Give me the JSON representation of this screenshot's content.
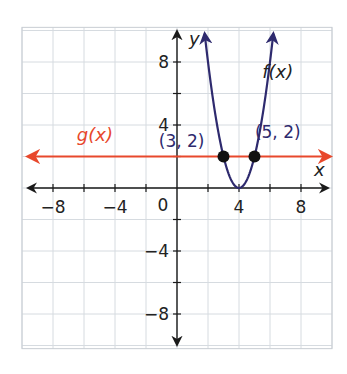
{
  "chart_data": {
    "type": "line",
    "title": "",
    "xlabel": "x",
    "ylabel": "y",
    "xlim": [
      -10,
      10
    ],
    "ylim": [
      -10.2,
      10.2
    ],
    "grid": true,
    "grid_step": 2,
    "x_ticks": [
      -8,
      -6,
      -4,
      -2,
      2,
      4,
      6,
      8
    ],
    "y_ticks": [
      -8,
      -6,
      -4,
      -2,
      2,
      4,
      6,
      8
    ],
    "x_tick_labels": [
      {
        "value": -8,
        "label": "−8"
      },
      {
        "value": -4,
        "label": "−4"
      },
      {
        "value": 4,
        "label": "4"
      },
      {
        "value": 8,
        "label": "8"
      }
    ],
    "y_tick_labels": [
      {
        "value": 8,
        "label": "8"
      },
      {
        "value": 4,
        "label": "4"
      },
      {
        "value": -4,
        "label": "−4"
      },
      {
        "value": -8,
        "label": "−8"
      }
    ],
    "origin_label": "0",
    "series": [
      {
        "name": "f(x)",
        "label": "f(x)",
        "kind": "parabola",
        "equation": "y = 2(x - 4)^2",
        "vertex": [
          4,
          0
        ],
        "color": "#2e2a6e",
        "label_pos": [
          6.5,
          7.0
        ]
      },
      {
        "name": "g(x)",
        "label": "g(x)",
        "kind": "horizontal_line",
        "equation": "y = 2",
        "value": 2,
        "color": "#e8482c",
        "label_pos": [
          -5.3,
          3.0
        ]
      }
    ],
    "points": [
      {
        "x": 3,
        "y": 2,
        "label": "(3, 2)",
        "label_pos": [
          0.3,
          2.6
        ]
      },
      {
        "x": 5,
        "y": 2,
        "label": "(5, 2)",
        "label_pos": [
          6.5,
          3.2
        ]
      }
    ]
  }
}
